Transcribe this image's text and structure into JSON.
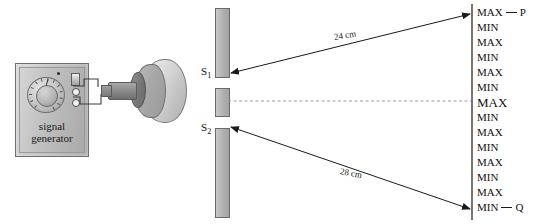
{
  "diagram": {
    "apparatus": {
      "signal_generator": {
        "label_line1": "signal",
        "label_line2": "generator",
        "dial_name": "frequency-dial",
        "terminal_count": 2
      },
      "speaker": {
        "name": "loudspeaker"
      },
      "barrier": {
        "name": "slit-barrier",
        "segments": 3,
        "slits": [
          {
            "id": "S1",
            "label": "S",
            "subscript": "1"
          },
          {
            "id": "S2",
            "label": "S",
            "subscript": "2"
          }
        ]
      }
    },
    "measurements": [
      {
        "id": "upper-path",
        "from": "P",
        "to": "S1",
        "value": "24 cm"
      },
      {
        "id": "lower-path",
        "from": "Q",
        "to": "S2",
        "value": "28 cm"
      }
    ],
    "screen": {
      "name": "detection-screen",
      "top_endpoint": "P",
      "bottom_endpoint": "Q",
      "fringes": [
        {
          "label": "MAX",
          "central": false
        },
        {
          "label": "MIN",
          "central": false
        },
        {
          "label": "MAX",
          "central": false
        },
        {
          "label": "MIN",
          "central": false
        },
        {
          "label": "MAX",
          "central": false
        },
        {
          "label": "MIN",
          "central": false
        },
        {
          "label": "MAX",
          "central": true
        },
        {
          "label": "MIN",
          "central": false
        },
        {
          "label": "MAX",
          "central": false
        },
        {
          "label": "MIN",
          "central": false
        },
        {
          "label": "MAX",
          "central": false
        },
        {
          "label": "MIN",
          "central": false
        },
        {
          "label": "MAX",
          "central": false
        },
        {
          "label": "MIN",
          "central": false
        }
      ]
    },
    "colors": {
      "line": "#1a1a1a",
      "dashed_axis": "#9a9a9a",
      "metal_fill": "#b4b4b4",
      "background": "#ffffff"
    }
  }
}
